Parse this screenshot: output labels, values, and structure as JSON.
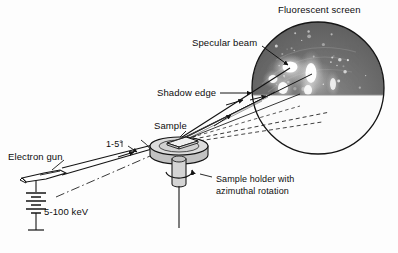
{
  "figure": {
    "background_color": "#fdfdfd",
    "width": 398,
    "height": 253
  },
  "labels": {
    "fluorescent_screen": "Fluorescent screen",
    "specular_beam": "Specular beam",
    "shadow_edge": "Shadow edge",
    "sample": "Sample",
    "electron_gun": "Electron gun",
    "incidence_angle": "1-5°",
    "beam_energy": "5-100 keV",
    "sample_holder_line1": "Sample holder with",
    "sample_holder_line2": "azimuthal rotation"
  },
  "colors": {
    "ink": "#0d0d0d",
    "line": "#161616",
    "screen_upper": "#6e6e6e",
    "screen_lower": "#fbfbfb",
    "holder_fill": "#c9c9c9",
    "holder_top": "#dedede",
    "sample_fill": "#ededed",
    "background": "#fdfdfd"
  },
  "screen": {
    "center_x": 318,
    "center_y": 88,
    "radius": 66,
    "shadow_edge_y": 95,
    "diffraction_spots": [
      {
        "x": 290,
        "y": 67,
        "rx": 7.5,
        "ry": 5.5,
        "intensity": 1.0
      },
      {
        "x": 311,
        "y": 73,
        "rx": 5.5,
        "ry": 10.0,
        "intensity": 0.95
      },
      {
        "x": 273,
        "y": 79,
        "rx": 4.5,
        "ry": 4.0,
        "intensity": 0.8
      },
      {
        "x": 283,
        "y": 88,
        "rx": 5.0,
        "ry": 6.0,
        "intensity": 0.85
      },
      {
        "x": 308,
        "y": 90,
        "rx": 4.0,
        "ry": 5.0,
        "intensity": 0.7
      },
      {
        "x": 333,
        "y": 84,
        "rx": 3.0,
        "ry": 6.0,
        "intensity": 0.55
      }
    ],
    "speckle_count": 54
  },
  "geometry": {
    "sample_point_x": 178,
    "sample_point_y": 140,
    "gun_tip_x": 58,
    "gun_tip_y": 176
  },
  "elements": {
    "electron_gun": "electron-gun",
    "battery_symbol": "battery-symbol",
    "sample_holder": "sample-holder",
    "rotation_arrow": "azimuthal-rotation-arrow",
    "screen": "fluorescent-screen"
  }
}
